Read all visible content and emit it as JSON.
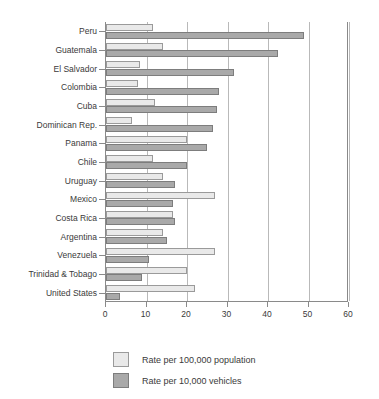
{
  "chart_data": {
    "type": "bar",
    "orientation": "horizontal",
    "title": "",
    "subtitle": "",
    "xlabel": "",
    "ylabel": "",
    "xlim": [
      0,
      60
    ],
    "xticks": [
      "0",
      "10",
      "20",
      "30",
      "40",
      "50",
      "60"
    ],
    "grid": "vertical",
    "legend_position": "bottom-left",
    "categories": [
      "Peru",
      "Guatemala",
      "El Salvador",
      "Colombia",
      "Cuba",
      "Dominican Rep.",
      "Panama",
      "Chile",
      "Uruguay",
      "Mexico",
      "Costa Rica",
      "Argentina",
      "Venezuela",
      "Trinidad & Tobago",
      "United States"
    ],
    "series": [
      {
        "name": "Rate per 100,000 population",
        "color": "#e9e9e9",
        "values": [
          11.5,
          14.0,
          8.5,
          8.0,
          12.0,
          6.5,
          20.0,
          11.5,
          14.0,
          27.0,
          16.5,
          14.0,
          27.0,
          20.0,
          22.0
        ]
      },
      {
        "name": "Rate per 10,000 vehicles",
        "color": "#a9a9a9",
        "values": [
          49.0,
          42.5,
          31.5,
          28.0,
          27.5,
          26.5,
          25.0,
          20.0,
          17.0,
          16.5,
          17.0,
          15.0,
          10.5,
          9.0,
          3.5
        ]
      }
    ]
  },
  "legend": {
    "items": [
      {
        "label": "Rate per 100,000 population",
        "color": "#e9e9e9"
      },
      {
        "label": "Rate per 10,000 vehicles",
        "color": "#a9a9a9"
      }
    ]
  }
}
